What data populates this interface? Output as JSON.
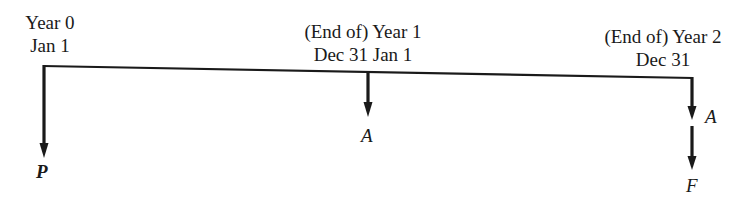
{
  "diagram": {
    "type": "cash-flow-timeline",
    "line_color": "#1a1a1a",
    "time_points": [
      {
        "id": "year0",
        "line1": "Year 0",
        "line2": "Jan 1"
      },
      {
        "id": "year1",
        "line1": "(End of) Year 1",
        "line2": "Dec 31 Jan 1"
      },
      {
        "id": "year2",
        "line1": "(End of) Year 2",
        "line2": "Dec 31"
      }
    ],
    "cash_flows": [
      {
        "at": "year0",
        "label": "P"
      },
      {
        "at": "year1",
        "label": "A"
      },
      {
        "at": "year2",
        "label": "A"
      },
      {
        "at": "year2",
        "label": "F"
      }
    ]
  }
}
